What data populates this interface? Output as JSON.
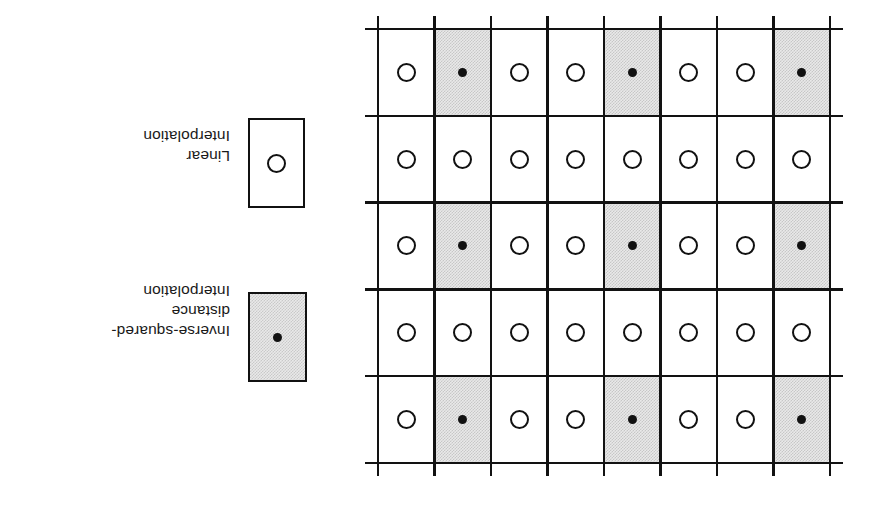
{
  "figure": {
    "orientation": "rotated-180",
    "legend": {
      "entries": [
        {
          "id": "linear",
          "caption": "Linear\nInterpolation",
          "swatch_style": "plain",
          "marker": "open-circle",
          "swatch_fill": "#ffffff",
          "marker_color": "#111111"
        },
        {
          "id": "inverse-squared-distance",
          "caption": "Inverse-squared-\ndistance\nInterpolation",
          "swatch_style": "shaded",
          "marker": "filled-dot",
          "swatch_fill": "#e9e9e9",
          "marker_color": "#111111"
        }
      ]
    },
    "grid": {
      "rows": 5,
      "columns": 8,
      "line_color": "#121212",
      "shaded_fill": "#e9e9e9",
      "plain_fill": "#ffffff",
      "cells": [
        [
          "circle",
          "dot",
          "circle",
          "circle",
          "dot",
          "circle",
          "circle",
          "dot"
        ],
        [
          "circle",
          "circle",
          "circle",
          "circle",
          "circle",
          "circle",
          "circle",
          "circle"
        ],
        [
          "circle",
          "dot",
          "circle",
          "circle",
          "dot",
          "circle",
          "circle",
          "dot"
        ],
        [
          "circle",
          "circle",
          "circle",
          "circle",
          "circle",
          "circle",
          "circle",
          "circle"
        ],
        [
          "circle",
          "dot",
          "circle",
          "circle",
          "dot",
          "circle",
          "circle",
          "dot"
        ]
      ]
    }
  }
}
